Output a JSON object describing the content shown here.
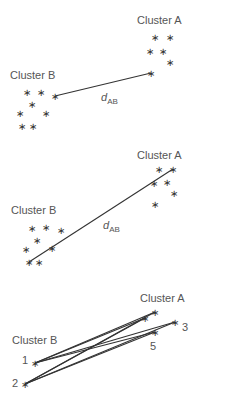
{
  "colors": {
    "ink": "#333333",
    "label": "#555555",
    "background": "#ffffff"
  },
  "panels": [
    {
      "name": "single-linkage",
      "cluster_a_label": "Cluster A",
      "cluster_b_label": "Cluster B",
      "distance_label": "d",
      "distance_sub": "AB",
      "cluster_a_points": [
        [
          155,
          37
        ],
        [
          170,
          37
        ],
        [
          150,
          51
        ],
        [
          163,
          51
        ],
        [
          170,
          62
        ],
        [
          151,
          73
        ]
      ],
      "cluster_b_points": [
        [
          27,
          92
        ],
        [
          41,
          92
        ],
        [
          55,
          96
        ],
        [
          32,
          104
        ],
        [
          20,
          113
        ],
        [
          46,
          113
        ],
        [
          22,
          126
        ],
        [
          33,
          126
        ]
      ],
      "links": [
        [
          [
            55,
            96
          ],
          [
            151,
            73
          ]
        ]
      ]
    },
    {
      "name": "complete-linkage",
      "cluster_a_label": "Cluster A",
      "cluster_b_label": "Cluster B",
      "distance_label": "d",
      "distance_sub": "AB",
      "cluster_a_points": [
        [
          159,
          169
        ],
        [
          173,
          169
        ],
        [
          154,
          183
        ],
        [
          167,
          182
        ],
        [
          174,
          193
        ],
        [
          155,
          204
        ]
      ],
      "cluster_b_points": [
        [
          32,
          228
        ],
        [
          46,
          227
        ],
        [
          61,
          230
        ],
        [
          37,
          240
        ],
        [
          26,
          249
        ],
        [
          52,
          248
        ],
        [
          29,
          262
        ],
        [
          39,
          262
        ]
      ],
      "links": [
        [
          [
            29,
            262
          ],
          [
            173,
            169
          ]
        ]
      ]
    },
    {
      "name": "average-linkage",
      "cluster_a_label": "Cluster A",
      "cluster_b_label": "Cluster B",
      "point_labels": {
        "p1": "1",
        "p2": "2",
        "p3": "3",
        "p5": "5"
      },
      "cluster_a_points": [
        [
          145,
          318
        ],
        [
          155,
          312
        ],
        [
          175,
          322
        ],
        [
          155,
          332
        ]
      ],
      "cluster_b_points": [
        [
          35,
          363
        ],
        [
          25,
          384
        ]
      ],
      "links": [
        [
          [
            35,
            363
          ],
          [
            145,
            318
          ]
        ],
        [
          [
            35,
            363
          ],
          [
            155,
            312
          ]
        ],
        [
          [
            35,
            363
          ],
          [
            175,
            322
          ]
        ],
        [
          [
            35,
            363
          ],
          [
            155,
            332
          ]
        ],
        [
          [
            25,
            384
          ],
          [
            145,
            318
          ]
        ],
        [
          [
            25,
            384
          ],
          [
            155,
            312
          ]
        ],
        [
          [
            25,
            384
          ],
          [
            175,
            322
          ]
        ],
        [
          [
            25,
            384
          ],
          [
            155,
            332
          ]
        ]
      ]
    }
  ]
}
